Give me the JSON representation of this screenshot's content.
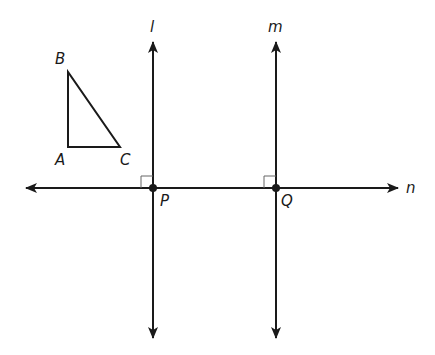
{
  "figure": {
    "width": 435,
    "height": 355,
    "stroke_color": "#1a1a1a",
    "marker_color": "#666666",
    "triangle": {
      "vertices": {
        "A": {
          "label": "A",
          "x": 68,
          "y": 147
        },
        "B": {
          "label": "B",
          "x": 68,
          "y": 72
        },
        "C": {
          "label": "C",
          "x": 120,
          "y": 147
        }
      }
    },
    "lines": {
      "l": {
        "label": "l",
        "x": 153,
        "y1": 42,
        "y2": 338
      },
      "m": {
        "label": "m",
        "x": 276,
        "y1": 42,
        "y2": 338
      },
      "n": {
        "label": "n",
        "y": 188,
        "x1": 26,
        "x2": 398
      }
    },
    "points": {
      "P": {
        "label": "P",
        "x": 153,
        "y": 188
      },
      "Q": {
        "label": "Q",
        "x": 276,
        "y": 188
      }
    },
    "right_angle_markers": [
      "P",
      "Q"
    ]
  }
}
